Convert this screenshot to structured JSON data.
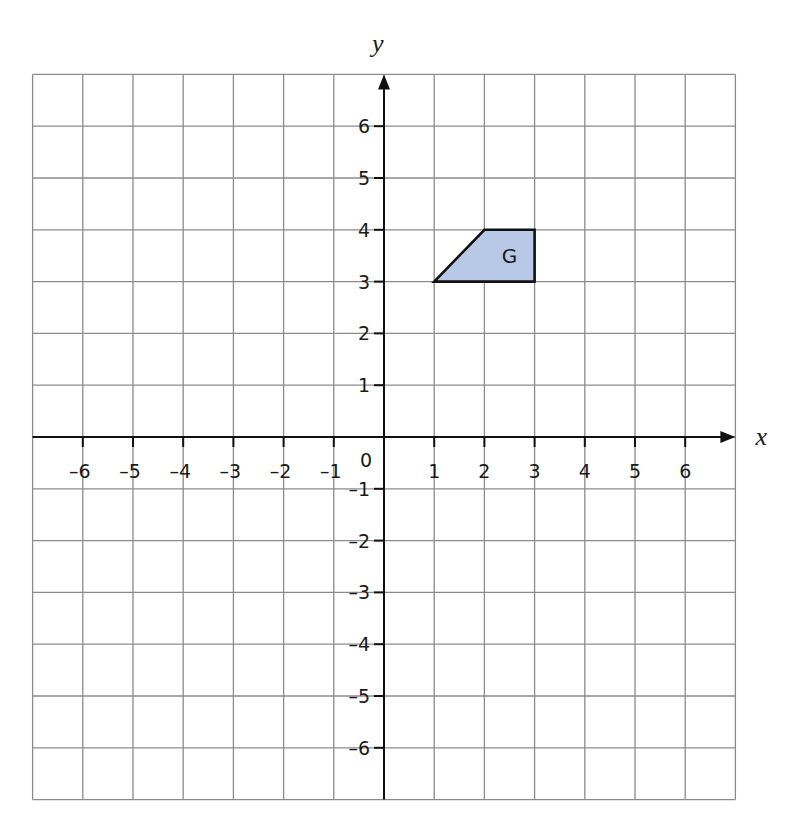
{
  "chart_data": {
    "type": "scatter",
    "title": "",
    "xlabel": "x",
    "ylabel": "y",
    "xlim": [
      -7,
      7
    ],
    "ylim": [
      -7,
      7
    ],
    "grid": true,
    "origin_label": "0",
    "x_ticks": [
      -6,
      -5,
      -4,
      -3,
      -2,
      -1,
      1,
      2,
      3,
      4,
      5,
      6
    ],
    "y_ticks": [
      6,
      5,
      4,
      3,
      2,
      1,
      -1,
      -2,
      -3,
      -4,
      -5,
      -6
    ],
    "x_tick_labels": [
      "–6",
      "–5",
      "–4",
      "–3",
      "–2",
      "–1",
      "1",
      "2",
      "3",
      "4",
      "5",
      "6"
    ],
    "y_tick_labels": [
      "6",
      "5",
      "4",
      "3",
      "2",
      "1",
      "–1",
      "–2",
      "–3",
      "–4",
      "–5",
      "–6"
    ],
    "shapes": [
      {
        "name": "G",
        "vertices": [
          [
            1,
            3
          ],
          [
            2,
            4
          ],
          [
            3,
            4
          ],
          [
            3,
            3
          ]
        ],
        "fill": "#b7c9e6",
        "stroke": "#111111"
      }
    ]
  },
  "colors": {
    "grid": "#8c8c8c",
    "axis": "#111111",
    "shape_fill": "#b7c9e6"
  }
}
